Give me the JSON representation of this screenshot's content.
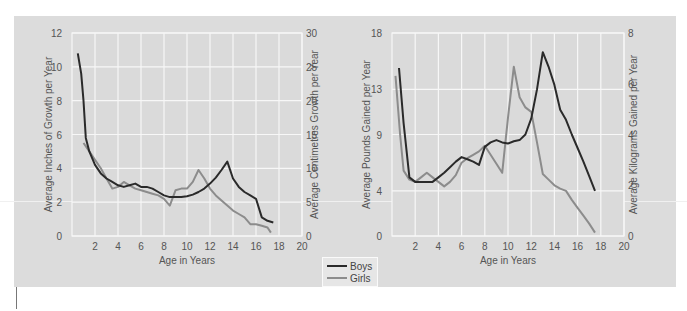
{
  "colors": {
    "boys": "#2a2a2a",
    "girls": "#8c8c8c",
    "panel": "#dcdcdc",
    "grid": "#f7f7f7",
    "text": "#555555"
  },
  "legend": {
    "items": [
      {
        "label": "Boys",
        "color": "#2a2a2a"
      },
      {
        "label": "Girls",
        "color": "#8c8c8c"
      }
    ]
  },
  "chart_data": [
    {
      "type": "line",
      "title": "",
      "xlabel": "Age in  Years",
      "ylabel": "Average Inches of Growth per Year",
      "ylabel_right": "Average Centimetres Growth per Year",
      "xlim": [
        0,
        20
      ],
      "ylim": [
        0,
        12
      ],
      "ylim_right": [
        0,
        30
      ],
      "x_ticks": [
        2,
        4,
        6,
        8,
        10,
        12,
        14,
        16,
        18,
        20
      ],
      "y_ticks": [
        0,
        2,
        4,
        6,
        8,
        10,
        12
      ],
      "y_ticks_right": [
        0,
        5,
        10,
        15,
        20,
        25,
        30
      ],
      "grid": true,
      "legend_position": "bottom-center",
      "series": [
        {
          "name": "Boys",
          "x": [
            0.5,
            0.8,
            1.0,
            1.2,
            1.5,
            2.0,
            2.5,
            3.0,
            3.5,
            4.0,
            4.5,
            5.0,
            5.5,
            6.0,
            6.5,
            7.0,
            7.5,
            8.0,
            8.5,
            9.0,
            9.5,
            10.0,
            10.5,
            11.0,
            11.5,
            12.0,
            12.5,
            13.0,
            13.5,
            14.0,
            14.5,
            15.0,
            15.5,
            16.0,
            16.5,
            17.0,
            17.5
          ],
          "values": [
            10.8,
            9.6,
            8.0,
            5.8,
            5.0,
            4.2,
            3.7,
            3.4,
            3.2,
            3.0,
            2.9,
            3.0,
            3.1,
            2.9,
            2.9,
            2.8,
            2.6,
            2.4,
            2.3,
            2.3,
            2.3,
            2.35,
            2.45,
            2.6,
            2.8,
            3.1,
            3.45,
            3.9,
            4.4,
            3.4,
            2.9,
            2.6,
            2.4,
            2.2,
            1.1,
            0.9,
            0.8
          ]
        },
        {
          "name": "Girls",
          "x": [
            1.0,
            1.5,
            2.0,
            2.5,
            3.0,
            3.5,
            4.0,
            4.5,
            5.0,
            5.5,
            6.0,
            6.5,
            7.0,
            7.5,
            8.0,
            8.5,
            9.0,
            9.5,
            10.0,
            10.5,
            11.0,
            11.5,
            12.0,
            12.5,
            13.0,
            13.5,
            14.0,
            14.5,
            15.0,
            15.5,
            16.0,
            16.5,
            17.0,
            17.3
          ],
          "values": [
            5.5,
            5.0,
            4.5,
            4.0,
            3.4,
            2.8,
            2.9,
            3.2,
            3.0,
            2.8,
            2.7,
            2.6,
            2.5,
            2.4,
            2.2,
            1.8,
            2.7,
            2.8,
            2.8,
            3.2,
            3.9,
            3.4,
            2.8,
            2.4,
            2.1,
            1.8,
            1.5,
            1.3,
            1.1,
            0.7,
            0.7,
            0.6,
            0.5,
            0.2
          ]
        }
      ]
    },
    {
      "type": "line",
      "title": "",
      "xlabel": "Age in  Years",
      "ylabel": "Average Pounds Gained per Year",
      "ylabel_right": "Average Kilograms Gained per Year",
      "xlim": [
        0,
        20
      ],
      "ylim": [
        0,
        18
      ],
      "ylim_right": [
        0,
        8
      ],
      "x_ticks": [
        2,
        4,
        6,
        8,
        10,
        12,
        14,
        16,
        18,
        20
      ],
      "y_ticks": [
        0,
        4,
        9,
        13,
        18
      ],
      "y_ticks_right": [
        0,
        2,
        4,
        6,
        8
      ],
      "grid": true,
      "series": [
        {
          "name": "Boys",
          "x": [
            0.6,
            1.0,
            1.5,
            2.0,
            2.5,
            3.0,
            3.5,
            4.0,
            4.5,
            5.0,
            5.5,
            6.0,
            6.5,
            7.0,
            7.5,
            8.0,
            8.5,
            9.0,
            9.5,
            10.0,
            10.5,
            11.0,
            11.5,
            12.0,
            12.5,
            13.0,
            13.5,
            14.0,
            14.5,
            15.0,
            15.5,
            16.0,
            16.5,
            17.0,
            17.5
          ],
          "values": [
            14.9,
            10.0,
            5.2,
            4.8,
            4.8,
            4.8,
            4.8,
            5.2,
            5.6,
            6.1,
            6.6,
            7.0,
            6.8,
            6.6,
            6.3,
            7.9,
            8.3,
            8.5,
            8.3,
            8.2,
            8.4,
            8.5,
            9.0,
            10.4,
            13.0,
            16.3,
            15.0,
            13.4,
            11.2,
            10.3,
            9.0,
            7.8,
            6.6,
            5.3,
            4.0
          ]
        },
        {
          "name": "Girls",
          "x": [
            0.3,
            0.7,
            1.0,
            1.5,
            2.0,
            2.5,
            3.0,
            3.5,
            4.0,
            4.5,
            5.0,
            5.5,
            6.0,
            6.5,
            7.0,
            7.5,
            8.0,
            8.5,
            9.0,
            9.5,
            10.0,
            10.5,
            11.0,
            11.5,
            12.0,
            12.5,
            13.0,
            13.5,
            14.0,
            14.5,
            15.0,
            15.5,
            16.0,
            16.5,
            17.0,
            17.5
          ],
          "values": [
            14.2,
            9.0,
            5.8,
            5.0,
            4.8,
            5.2,
            5.6,
            5.2,
            4.8,
            4.4,
            4.8,
            5.4,
            6.5,
            6.9,
            7.2,
            7.5,
            8.0,
            7.2,
            6.4,
            5.6,
            10.5,
            15.0,
            12.3,
            11.4,
            11.0,
            8.3,
            5.5,
            5.0,
            4.5,
            4.2,
            4.0,
            3.2,
            2.5,
            1.8,
            1.1,
            0.3
          ]
        }
      ]
    }
  ]
}
